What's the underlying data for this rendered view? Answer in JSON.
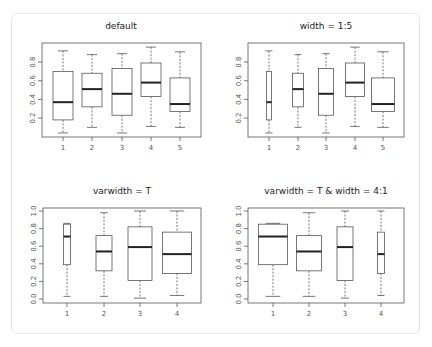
{
  "chart_data": [
    {
      "type": "boxplot",
      "title": "default",
      "xlabel": "",
      "ylabel": "",
      "categories": [
        "1",
        "2",
        "3",
        "4",
        "5"
      ],
      "yticks": [
        "0.2",
        "0.4",
        "0.6",
        "0.8"
      ],
      "ylim": [
        0.0,
        1.0
      ],
      "grid": false,
      "boxes": [
        {
          "min": 0.04,
          "q1": 0.18,
          "median": 0.37,
          "q3": 0.7,
          "max": 0.92,
          "width_px": 20
        },
        {
          "min": 0.1,
          "q1": 0.32,
          "median": 0.51,
          "q3": 0.68,
          "max": 0.88,
          "width_px": 20
        },
        {
          "min": 0.04,
          "q1": 0.23,
          "median": 0.46,
          "q3": 0.73,
          "max": 0.89,
          "width_px": 20
        },
        {
          "min": 0.11,
          "q1": 0.43,
          "median": 0.58,
          "q3": 0.79,
          "max": 0.96,
          "width_px": 20
        },
        {
          "min": 0.1,
          "q1": 0.27,
          "median": 0.35,
          "q3": 0.63,
          "max": 0.91,
          "width_px": 20
        }
      ]
    },
    {
      "type": "boxplot",
      "title": "width = 1:5",
      "xlabel": "",
      "ylabel": "",
      "categories": [
        "1",
        "2",
        "3",
        "4",
        "5"
      ],
      "yticks": [
        "0.2",
        "0.4",
        "0.6",
        "0.8"
      ],
      "ylim": [
        0.0,
        1.0
      ],
      "grid": false,
      "boxes": [
        {
          "min": 0.04,
          "q1": 0.18,
          "median": 0.37,
          "q3": 0.7,
          "max": 0.92,
          "width_px": 5
        },
        {
          "min": 0.1,
          "q1": 0.32,
          "median": 0.51,
          "q3": 0.68,
          "max": 0.88,
          "width_px": 11
        },
        {
          "min": 0.04,
          "q1": 0.23,
          "median": 0.46,
          "q3": 0.73,
          "max": 0.89,
          "width_px": 15
        },
        {
          "min": 0.11,
          "q1": 0.43,
          "median": 0.58,
          "q3": 0.79,
          "max": 0.96,
          "width_px": 19
        },
        {
          "min": 0.1,
          "q1": 0.27,
          "median": 0.35,
          "q3": 0.63,
          "max": 0.91,
          "width_px": 23
        }
      ]
    },
    {
      "type": "boxplot",
      "title": "varwidth = T",
      "xlabel": "",
      "ylabel": "",
      "categories": [
        "1",
        "2",
        "3",
        "4"
      ],
      "yticks": [
        "0.0",
        "0.2",
        "0.4",
        "0.6",
        "0.8",
        "1.0"
      ],
      "ylim": [
        0.0,
        1.0
      ],
      "grid": false,
      "boxes": [
        {
          "min": 0.03,
          "q1": 0.39,
          "median": 0.71,
          "q3": 0.85,
          "max": 0.86,
          "width_px": 7
        },
        {
          "min": 0.03,
          "q1": 0.32,
          "median": 0.54,
          "q3": 0.72,
          "max": 0.98,
          "width_px": 16
        },
        {
          "min": 0.01,
          "q1": 0.21,
          "median": 0.59,
          "q3": 0.82,
          "max": 1.0,
          "width_px": 24
        },
        {
          "min": 0.04,
          "q1": 0.29,
          "median": 0.51,
          "q3": 0.76,
          "max": 1.0,
          "width_px": 29
        }
      ]
    },
    {
      "type": "boxplot",
      "title": "varwidth = T & width = 4:1",
      "xlabel": "",
      "ylabel": "",
      "categories": [
        "1",
        "2",
        "3",
        "4"
      ],
      "yticks": [
        "0.0",
        "0.2",
        "0.4",
        "0.6",
        "0.8",
        "1.0"
      ],
      "ylim": [
        0.0,
        1.0
      ],
      "grid": false,
      "boxes": [
        {
          "min": 0.03,
          "q1": 0.39,
          "median": 0.71,
          "q3": 0.85,
          "max": 0.86,
          "width_px": 29
        },
        {
          "min": 0.03,
          "q1": 0.32,
          "median": 0.54,
          "q3": 0.72,
          "max": 0.98,
          "width_px": 25
        },
        {
          "min": 0.01,
          "q1": 0.21,
          "median": 0.59,
          "q3": 0.82,
          "max": 1.0,
          "width_px": 16
        },
        {
          "min": 0.04,
          "q1": 0.29,
          "median": 0.51,
          "q3": 0.76,
          "max": 1.0,
          "width_px": 7
        }
      ]
    }
  ]
}
